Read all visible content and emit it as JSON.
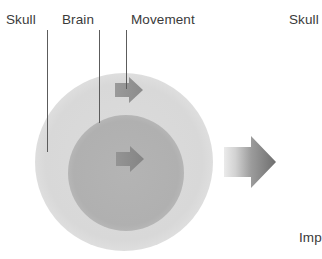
{
  "figure": {
    "background_color": "#ffffff",
    "labels": {
      "skull_left": "Skull",
      "brain": "Brain",
      "movement": "Movement",
      "skull_right": "Skull",
      "impact": "Imp"
    },
    "label_color": "#3a3a3a",
    "leader_line_color": "#5c5c5c",
    "shapes": {
      "outer_circle": {
        "name": "skull-circle",
        "cx": 124,
        "cy": 162,
        "r": 89,
        "fill": "#d9d9d9"
      },
      "inner_circle": {
        "name": "brain-circle",
        "cx": 126,
        "cy": 173,
        "r": 58,
        "fill": "#b3b3b3"
      },
      "arrow_small_top": {
        "name": "skull-movement-arrow",
        "fill": "#8f8f8f",
        "direction": "right"
      },
      "arrow_small_center": {
        "name": "brain-movement-arrow",
        "fill": "#8a8a8a",
        "direction": "right"
      },
      "arrow_impact": {
        "name": "impact-arrow",
        "gradient_from": "#e8e8e8",
        "gradient_to": "#6e6e6e",
        "direction": "right"
      }
    }
  }
}
